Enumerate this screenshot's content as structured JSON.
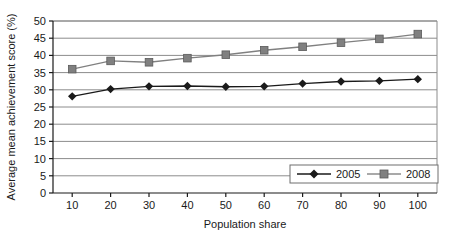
{
  "chart_data": {
    "type": "line",
    "title": "",
    "xlabel": "Population share",
    "ylabel": "Average mean achievement score (%)",
    "x": [
      10,
      20,
      30,
      40,
      50,
      60,
      70,
      80,
      90,
      100
    ],
    "xticklabels": [
      "10",
      "20",
      "30",
      "40",
      "50",
      "60",
      "70",
      "80",
      "90",
      "100"
    ],
    "yticklabels": [
      "0",
      "5",
      "10",
      "15",
      "20",
      "25",
      "30",
      "35",
      "40",
      "45",
      "50"
    ],
    "yticks": [
      0,
      5,
      10,
      15,
      20,
      25,
      30,
      35,
      40,
      45,
      50
    ],
    "ylim": [
      0,
      50
    ],
    "xlim": [
      5,
      105
    ],
    "grid": "horizontal",
    "legend_position": "bottom-right",
    "series": [
      {
        "name": "2005",
        "marker": "diamond",
        "color": "#1a1a1a",
        "values": [
          28.1,
          30.2,
          31.0,
          31.1,
          30.9,
          31.0,
          31.8,
          32.4,
          32.6,
          33.1
        ]
      },
      {
        "name": "2008",
        "marker": "square",
        "color": "#808080",
        "values": [
          36.0,
          38.4,
          38.0,
          39.2,
          40.2,
          41.5,
          42.5,
          43.7,
          44.8,
          46.2
        ]
      }
    ]
  },
  "legend": {
    "items": [
      {
        "label": "2005"
      },
      {
        "label": "2008"
      }
    ]
  },
  "colors": {
    "series_2005": "#1a1a1a",
    "series_2008": "#808080",
    "gridline": "#8c8c8c",
    "axis": "#1a1a1a",
    "plot_border": "#8c8c8c",
    "background": "#ffffff"
  }
}
